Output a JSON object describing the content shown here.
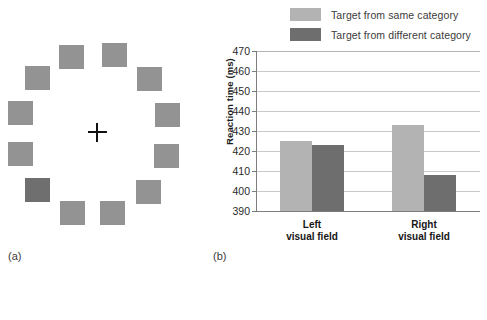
{
  "figure": {
    "panel_a": {
      "caption": "(a)",
      "fixation_icon": "plus-cross",
      "square_count": 12,
      "normal_color": "#939393",
      "target_color": "#6f6f6f",
      "squares": [
        {
          "index": 1,
          "x": 59,
          "y": 45,
          "is_target": false
        },
        {
          "index": 2,
          "x": 102,
          "y": 43,
          "is_target": false
        },
        {
          "index": 3,
          "x": 137,
          "y": 67,
          "is_target": false
        },
        {
          "index": 4,
          "x": 155,
          "y": 103,
          "is_target": false
        },
        {
          "index": 5,
          "x": 154,
          "y": 144,
          "is_target": false
        },
        {
          "index": 6,
          "x": 136,
          "y": 180,
          "is_target": false
        },
        {
          "index": 7,
          "x": 100,
          "y": 201,
          "is_target": false
        },
        {
          "index": 8,
          "x": 60,
          "y": 201,
          "is_target": false
        },
        {
          "index": 9,
          "x": 25,
          "y": 178,
          "is_target": true
        },
        {
          "index": 10,
          "x": 8,
          "y": 142,
          "is_target": false
        },
        {
          "index": 11,
          "x": 8,
          "y": 101,
          "is_target": false
        },
        {
          "index": 12,
          "x": 25,
          "y": 66,
          "is_target": false
        }
      ]
    },
    "panel_b": {
      "caption": "(b)"
    }
  },
  "chart_data": {
    "type": "bar",
    "title": "",
    "xlabel": "",
    "ylabel": "Reaction time (ms)",
    "ylim": [
      390,
      470
    ],
    "yticks": [
      390,
      400,
      410,
      420,
      430,
      440,
      450,
      460,
      470
    ],
    "ytick_labels": [
      "390",
      "400",
      "410",
      "420",
      "430",
      "440",
      "450",
      "460",
      "470"
    ],
    "grid": true,
    "legend_position": "top-right",
    "categories": [
      "Left\nvisual field",
      "Right\nvisual field"
    ],
    "category_labels": [
      {
        "line1": "Left",
        "line2": "visual field"
      },
      {
        "line1": "Right",
        "line2": "visual field"
      }
    ],
    "series": [
      {
        "name": "Target from same category",
        "color": "#b3b3b3",
        "values": [
          425,
          433
        ]
      },
      {
        "name": "Target from different category",
        "color": "#6e6e6e",
        "values": [
          423,
          408
        ]
      }
    ]
  }
}
